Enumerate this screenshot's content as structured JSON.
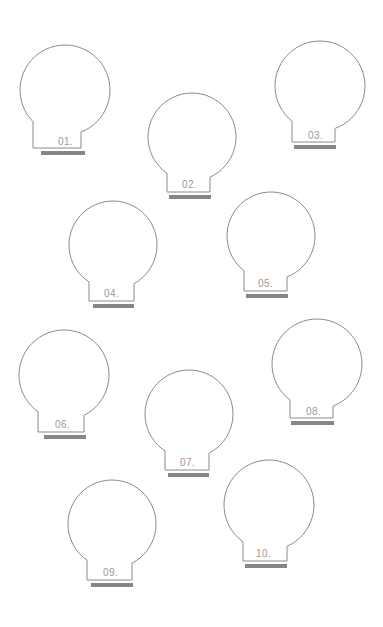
{
  "canvas": {
    "width": 383,
    "height": 627,
    "background": "#ffffff",
    "outline_color": "#8a8a8a",
    "bar_color": "#868686",
    "label_color": "#9a9a9a"
  },
  "shapes": [
    {
      "label": "01.",
      "circle": {
        "cx": 65,
        "cy": 90,
        "r": 45
      },
      "neck": {
        "x": 33,
        "y": 130,
        "width": 48,
        "height": 18
      },
      "bar": {
        "x": 41,
        "y": 151,
        "width": 44,
        "height": 4
      },
      "label_pos": {
        "x": 58,
        "y": 136
      }
    },
    {
      "label": "02.",
      "circle": {
        "cx": 192,
        "cy": 137,
        "r": 44
      },
      "neck": {
        "x": 167,
        "y": 174,
        "width": 43,
        "height": 18
      },
      "bar": {
        "x": 169,
        "y": 195,
        "width": 42,
        "height": 4
      },
      "label_pos": {
        "x": 182,
        "y": 179
      }
    },
    {
      "label": "03.",
      "circle": {
        "cx": 320,
        "cy": 86,
        "r": 45
      },
      "neck": {
        "x": 292,
        "y": 126,
        "width": 43,
        "height": 16
      },
      "bar": {
        "x": 294,
        "y": 145,
        "width": 42,
        "height": 4
      },
      "label_pos": {
        "x": 308,
        "y": 130
      }
    },
    {
      "label": "04.",
      "circle": {
        "cx": 113,
        "cy": 245,
        "r": 44
      },
      "neck": {
        "x": 89,
        "y": 283,
        "width": 45,
        "height": 18
      },
      "bar": {
        "x": 93,
        "y": 304,
        "width": 41,
        "height": 4
      },
      "label_pos": {
        "x": 104,
        "y": 288
      }
    },
    {
      "label": "05.",
      "circle": {
        "cx": 271,
        "cy": 236,
        "r": 44
      },
      "neck": {
        "x": 244,
        "y": 273,
        "width": 43,
        "height": 18
      },
      "bar": {
        "x": 246,
        "y": 294,
        "width": 42,
        "height": 4
      },
      "label_pos": {
        "x": 258,
        "y": 278
      }
    },
    {
      "label": "06.",
      "circle": {
        "cx": 64,
        "cy": 375,
        "r": 45
      },
      "neck": {
        "x": 38,
        "y": 414,
        "width": 46,
        "height": 18
      },
      "bar": {
        "x": 44,
        "y": 435,
        "width": 42,
        "height": 4
      },
      "label_pos": {
        "x": 55,
        "y": 419
      }
    },
    {
      "label": "07.",
      "circle": {
        "cx": 189,
        "cy": 414,
        "r": 44
      },
      "neck": {
        "x": 165,
        "y": 452,
        "width": 44,
        "height": 18
      },
      "bar": {
        "x": 168,
        "y": 473,
        "width": 41,
        "height": 4
      },
      "label_pos": {
        "x": 180,
        "y": 457
      }
    },
    {
      "label": "08.",
      "circle": {
        "cx": 317,
        "cy": 364,
        "r": 45
      },
      "neck": {
        "x": 290,
        "y": 401,
        "width": 43,
        "height": 17
      },
      "bar": {
        "x": 291,
        "y": 421,
        "width": 43,
        "height": 4
      },
      "label_pos": {
        "x": 306,
        "y": 406
      }
    },
    {
      "label": "09.",
      "circle": {
        "cx": 112,
        "cy": 524,
        "r": 44
      },
      "neck": {
        "x": 87,
        "y": 562,
        "width": 45,
        "height": 18
      },
      "bar": {
        "x": 91,
        "y": 583,
        "width": 42,
        "height": 4
      },
      "label_pos": {
        "x": 103,
        "y": 567
      }
    },
    {
      "label": "10.",
      "circle": {
        "cx": 269,
        "cy": 505,
        "r": 45
      },
      "neck": {
        "x": 243,
        "y": 544,
        "width": 44,
        "height": 17
      },
      "bar": {
        "x": 245,
        "y": 564,
        "width": 42,
        "height": 4
      },
      "label_pos": {
        "x": 256,
        "y": 548
      }
    }
  ]
}
